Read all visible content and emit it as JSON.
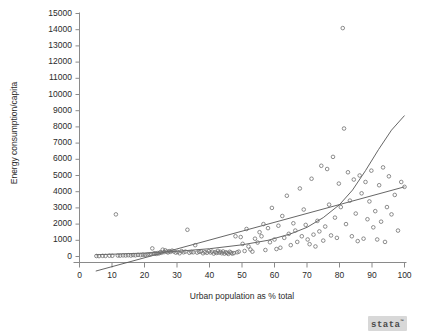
{
  "chart_data": {
    "type": "scatter",
    "title": "",
    "xlabel": "Urban population as % total",
    "ylabel": "Energy consumption/capita",
    "xlim": [
      0,
      100
    ],
    "ylim": [
      0,
      15000
    ],
    "xticks": [
      0,
      10,
      20,
      30,
      40,
      50,
      60,
      70,
      80,
      90,
      100
    ],
    "yticks": [
      0,
      1000,
      2000,
      3000,
      4000,
      5000,
      6000,
      7000,
      8000,
      9000,
      10000,
      11000,
      12000,
      13000,
      14000,
      15000
    ],
    "xtick_labels": [
      "0",
      "10",
      "20",
      "30",
      "40",
      "50",
      "60",
      "70",
      "80",
      "90",
      "100"
    ],
    "ytick_labels": [
      "0",
      "1000",
      "2000",
      "3000",
      "4000",
      "5000",
      "6000",
      "7000",
      "8000",
      "9000",
      "10000",
      "11000",
      "12000",
      "13000",
      "14000",
      "15000"
    ],
    "grid": false,
    "legend": false,
    "marker": "open-circle",
    "marker_color": "#707070",
    "line_color": "#555555",
    "points": [
      [
        5.2,
        30
      ],
      [
        6.0,
        25
      ],
      [
        7.1,
        40
      ],
      [
        8.0,
        35
      ],
      [
        9.2,
        50
      ],
      [
        10.1,
        45
      ],
      [
        11.2,
        2600
      ],
      [
        11.8,
        60
      ],
      [
        12.5,
        55
      ],
      [
        13.4,
        70
      ],
      [
        14.2,
        65
      ],
      [
        15.0,
        80
      ],
      [
        15.8,
        60
      ],
      [
        16.5,
        90
      ],
      [
        17.2,
        75
      ],
      [
        18.0,
        100
      ],
      [
        18.8,
        85
      ],
      [
        19.5,
        110
      ],
      [
        20.2,
        95
      ],
      [
        20.9,
        120
      ],
      [
        21.5,
        130
      ],
      [
        22.0,
        150
      ],
      [
        22.4,
        500
      ],
      [
        22.8,
        180
      ],
      [
        23.2,
        200
      ],
      [
        23.6,
        160
      ],
      [
        24.0,
        210
      ],
      [
        24.4,
        190
      ],
      [
        24.8,
        260
      ],
      [
        25.2,
        230
      ],
      [
        25.6,
        420
      ],
      [
        26.0,
        270
      ],
      [
        26.4,
        380
      ],
      [
        26.8,
        300
      ],
      [
        27.2,
        250
      ],
      [
        27.6,
        330
      ],
      [
        28.0,
        290
      ],
      [
        28.5,
        360
      ],
      [
        29.0,
        310
      ],
      [
        29.6,
        240
      ],
      [
        30.2,
        280
      ],
      [
        30.8,
        200
      ],
      [
        31.4,
        330
      ],
      [
        32.0,
        260
      ],
      [
        32.6,
        300
      ],
      [
        33.2,
        1650
      ],
      [
        33.8,
        230
      ],
      [
        34.4,
        280
      ],
      [
        35.0,
        260
      ],
      [
        35.6,
        700
      ],
      [
        36.2,
        240
      ],
      [
        36.8,
        290
      ],
      [
        37.4,
        310
      ],
      [
        38.0,
        200
      ],
      [
        38.6,
        270
      ],
      [
        39.2,
        230
      ],
      [
        39.8,
        330
      ],
      [
        40.3,
        250
      ],
      [
        40.8,
        300
      ],
      [
        41.3,
        180
      ],
      [
        41.8,
        270
      ],
      [
        42.2,
        220
      ],
      [
        42.6,
        350
      ],
      [
        43.0,
        240
      ],
      [
        43.4,
        290
      ],
      [
        43.8,
        200
      ],
      [
        44.2,
        310
      ],
      [
        44.6,
        180
      ],
      [
        45.0,
        260
      ],
      [
        45.4,
        220
      ],
      [
        45.8,
        160
      ],
      [
        46.2,
        290
      ],
      [
        46.6,
        240
      ],
      [
        47.0,
        180
      ],
      [
        47.5,
        210
      ],
      [
        48.0,
        1250
      ],
      [
        48.5,
        260
      ],
      [
        49.0,
        300
      ],
      [
        49.6,
        1200
      ],
      [
        50.2,
        780
      ],
      [
        50.8,
        340
      ],
      [
        51.4,
        1700
      ],
      [
        52.0,
        620
      ],
      [
        52.6,
        430
      ],
      [
        53.2,
        300
      ],
      [
        54.0,
        1100
      ],
      [
        54.8,
        860
      ],
      [
        55.4,
        1500
      ],
      [
        56.0,
        1250
      ],
      [
        56.6,
        2000
      ],
      [
        57.2,
        400
      ],
      [
        58.0,
        1750
      ],
      [
        58.6,
        880
      ],
      [
        59.2,
        3000
      ],
      [
        60.0,
        1050
      ],
      [
        60.6,
        460
      ],
      [
        61.2,
        1900
      ],
      [
        61.8,
        540
      ],
      [
        62.4,
        2500
      ],
      [
        63.0,
        1150
      ],
      [
        63.8,
        3750
      ],
      [
        64.4,
        1400
      ],
      [
        65.0,
        700
      ],
      [
        65.8,
        2050
      ],
      [
        66.4,
        1600
      ],
      [
        67.0,
        900
      ],
      [
        67.8,
        4200
      ],
      [
        68.4,
        1250
      ],
      [
        69.0,
        2900
      ],
      [
        69.6,
        1950
      ],
      [
        70.2,
        1050
      ],
      [
        70.8,
        760
      ],
      [
        71.4,
        4800
      ],
      [
        72.0,
        1350
      ],
      [
        72.6,
        620
      ],
      [
        73.2,
        2200
      ],
      [
        73.8,
        1550
      ],
      [
        74.4,
        5600
      ],
      [
        75.0,
        980
      ],
      [
        75.6,
        1850
      ],
      [
        76.2,
        5400
      ],
      [
        76.8,
        3200
      ],
      [
        77.4,
        1300
      ],
      [
        78.0,
        6150
      ],
      [
        78.6,
        2400
      ],
      [
        79.2,
        1150
      ],
      [
        79.8,
        4500
      ],
      [
        80.4,
        3050
      ],
      [
        81.0,
        14100
      ],
      [
        81.4,
        7900
      ],
      [
        82.0,
        2000
      ],
      [
        82.6,
        5200
      ],
      [
        83.2,
        3450
      ],
      [
        83.8,
        1250
      ],
      [
        84.4,
        4750
      ],
      [
        85.0,
        2650
      ],
      [
        85.6,
        950
      ],
      [
        86.2,
        5000
      ],
      [
        86.8,
        3900
      ],
      [
        87.4,
        1100
      ],
      [
        88.0,
        4600
      ],
      [
        88.6,
        2300
      ],
      [
        89.2,
        3400
      ],
      [
        89.8,
        5300
      ],
      [
        90.4,
        1800
      ],
      [
        91.0,
        2800
      ],
      [
        91.6,
        1050
      ],
      [
        92.2,
        4400
      ],
      [
        92.8,
        2150
      ],
      [
        93.4,
        5500
      ],
      [
        94.0,
        900
      ],
      [
        94.6,
        3050
      ],
      [
        95.2,
        4950
      ],
      [
        96.0,
        2600
      ],
      [
        97.0,
        3800
      ],
      [
        98.0,
        1600
      ],
      [
        99.0,
        4600
      ],
      [
        100.0,
        4300
      ]
    ],
    "fit_lines": [
      {
        "name": "linear-fit",
        "kind": "line",
        "points": [
          [
            5.0,
            -900
          ],
          [
            100.0,
            4300
          ]
        ]
      },
      {
        "name": "exponential-fit",
        "kind": "curve",
        "points": [
          [
            5.0,
            110
          ],
          [
            10.0,
            140
          ],
          [
            20.0,
            210
          ],
          [
            30.0,
            320
          ],
          [
            40.0,
            480
          ],
          [
            50.0,
            720
          ],
          [
            58.0,
            1000
          ],
          [
            65.0,
            1400
          ],
          [
            70.0,
            1800
          ],
          [
            75.0,
            2400
          ],
          [
            80.0,
            3200
          ],
          [
            84.0,
            4100
          ],
          [
            88.0,
            5300
          ],
          [
            92.0,
            6600
          ],
          [
            96.0,
            7800
          ],
          [
            100.0,
            8700
          ]
        ]
      }
    ]
  },
  "branding": {
    "logo_text": "stata",
    "logo_mark": "™"
  },
  "top_clip": {
    "text": ""
  }
}
